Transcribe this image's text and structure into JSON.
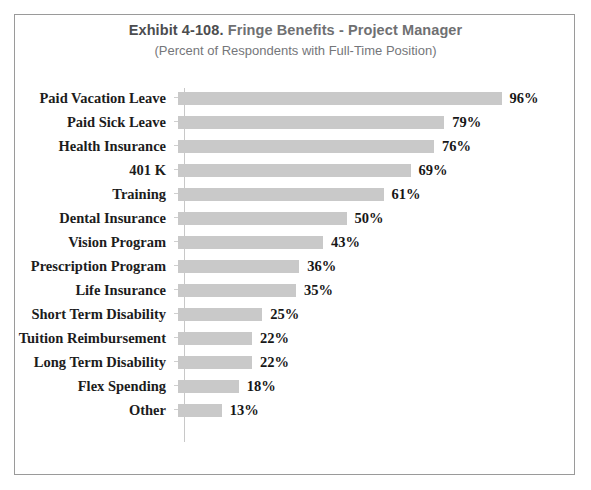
{
  "chart_data": {
    "type": "bar",
    "orientation": "horizontal",
    "title": "Exhibit 4-108.  Fringe Benefits - Project Manager",
    "title_prefix": "Exhibit 4-108.",
    "title_main": "Fringe Benefits - Project Manager",
    "subtitle": "(Percent of Respondents with Full-Time Position)",
    "xlabel": "",
    "ylabel": "",
    "xlim": [
      0,
      100
    ],
    "grid": false,
    "legend": "none",
    "value_suffix": "%",
    "bar_color": "#c9c9c9",
    "axis_color": "#c8c8c8",
    "label_color": "#1c1c1c",
    "title_color": "#6f7072",
    "categories": [
      "Paid Vacation Leave",
      "Paid Sick Leave",
      "Health Insurance",
      "401 K",
      "Training",
      "Dental Insurance",
      "Vision Program",
      "Prescription Program",
      "Life Insurance",
      "Short Term Disability",
      "Tuition Reimbursement",
      "Long Term Disability",
      "Flex Spending",
      "Other"
    ],
    "values": [
      96,
      79,
      76,
      69,
      61,
      50,
      43,
      36,
      35,
      25,
      22,
      22,
      18,
      13
    ],
    "value_labels": [
      "96%",
      "79%",
      "76%",
      "69%",
      "61%",
      "50%",
      "43%",
      "36%",
      "35%",
      "25%",
      "22%",
      "22%",
      "18%",
      "13%"
    ]
  }
}
